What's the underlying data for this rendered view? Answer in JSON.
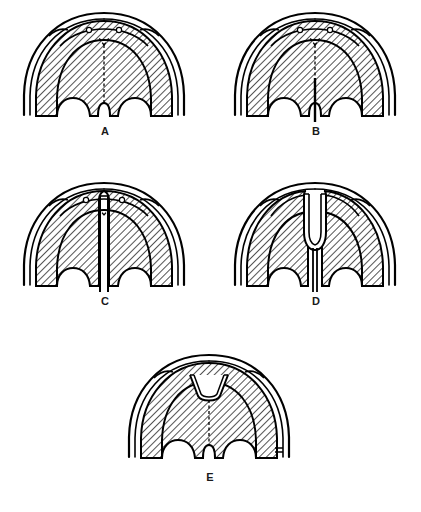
{
  "figure": {
    "width": 421,
    "height": 512,
    "background_color": "#ffffff",
    "ink_color": "#000000",
    "hatch_color": "#1a1a1a",
    "panel_count": 5
  },
  "panels": [
    {
      "id": "a",
      "label": "A",
      "description": "Normal palate with intact hard and soft palate",
      "cleft_type": "none",
      "foramina_count": 2,
      "has_cleft_line": false,
      "midline_marking": "dashed-median-raphe"
    },
    {
      "id": "b",
      "label": "B",
      "description": "Cleft of the soft palate (uvula and velum)",
      "cleft_type": "soft-palate",
      "foramina_count": 2,
      "has_cleft_line": true,
      "midline_marking": "dashed-median-raphe"
    },
    {
      "id": "c",
      "label": "C",
      "description": "Cleft of the soft and hard palate extending to the incisive foramen",
      "cleft_type": "soft-and-hard-palate",
      "foramina_count": 2,
      "has_cleft_line": true,
      "midline_marking": "dashed-median-raphe"
    },
    {
      "id": "d",
      "label": "D",
      "description": "Complete unilateral/bilateral cleft of the entire palate",
      "cleft_type": "complete-palate",
      "foramina_count": 2,
      "has_cleft_line": true,
      "midline_marking": "none"
    },
    {
      "id": "e",
      "label": "E",
      "description": "Submucous cleft with notch of the posterior hard palate",
      "cleft_type": "submucous",
      "foramina_count": 2,
      "has_cleft_line": false,
      "midline_marking": "dashed-median-raphe"
    }
  ]
}
